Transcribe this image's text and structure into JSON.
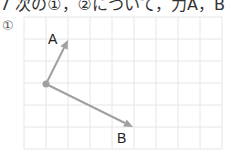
{
  "header": {
    "text": "7 次の①，②について，力A，Bの"
  },
  "problem": {
    "number": "①"
  },
  "diagram": {
    "grid": {
      "left": 24,
      "top": 17,
      "cell": 22,
      "cols": 9,
      "rows": 6,
      "line_color": "#e6e6e6"
    },
    "origin": {
      "x": 46,
      "y": 84
    },
    "vectors": [
      {
        "label": "A",
        "tip": {
          "x": 68,
          "y": 40
        },
        "label_pos": {
          "x": 48,
          "y": 44
        }
      },
      {
        "label": "B",
        "tip": {
          "x": 133,
          "y": 127
        },
        "label_pos": {
          "x": 117,
          "y": 143
        }
      }
    ],
    "arrow_color": "#a0a0a0"
  }
}
